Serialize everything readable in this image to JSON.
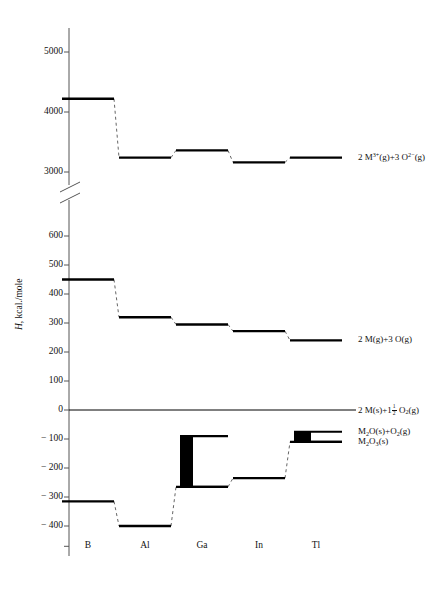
{
  "figure": {
    "y_axis_title": "H, kcal./mole",
    "caption": ""
  },
  "chart_data": {
    "type": "line",
    "title": "",
    "xlabel": "",
    "ylabel": "H, kcal./mole",
    "categories": [
      "B",
      "Al",
      "Ga",
      "In",
      "Tl"
    ],
    "grid": false,
    "legend_position": "right-inline",
    "axis_break": {
      "between": [
        700,
        2900
      ],
      "style": "double-slash"
    },
    "upper_axis": {
      "ticks": [
        3000,
        4000,
        5000
      ],
      "range": [
        2900,
        5400
      ]
    },
    "lower_axis": {
      "ticks": [
        -400,
        -300,
        -200,
        -100,
        0,
        100,
        200,
        300,
        400,
        500,
        600
      ],
      "range": [
        -470,
        700
      ]
    },
    "series": [
      {
        "name": "2 M3+(g)+3 O2-(g)",
        "label_html": "2 M<sup>3+</sup>(g)+3 O<sup>2−</sup>(g)",
        "values": [
          4220,
          3240,
          3360,
          3160,
          3240
        ],
        "style": "dashed-connector-solid-level"
      },
      {
        "name": "2 M(g)+3 O(g)",
        "label_html": "2 M(g)+3 O(g)",
        "values": [
          450,
          320,
          295,
          272,
          240
        ],
        "style": "dashed-connector-solid-level"
      },
      {
        "name": "2 M(s)+1 1/2 O2(g)",
        "label_html": "2 M(s)+1<frac>1/2</frac> O<sub>2</sub>(g)",
        "values": [
          0,
          0,
          0,
          0,
          0
        ],
        "style": "solid-baseline"
      },
      {
        "name": "M2O(s)+O2(g)",
        "label_html": "M<sub>2</sub>O(s)+O<sub>2</sub>(g)",
        "values": [
          null,
          null,
          -90,
          null,
          -75
        ],
        "style": "bar-top"
      },
      {
        "name": "M2O3(s)",
        "label_html": "M<sub>2</sub>O<sub>3</sub>(s)",
        "values": [
          -315,
          -400,
          -265,
          -235,
          -110
        ],
        "style": "dashed-connector-solid-level"
      }
    ],
    "bars": [
      {
        "category": "Ga",
        "top": -90,
        "bottom": -265,
        "fill": "#000000"
      },
      {
        "category": "Tl",
        "top": -75,
        "bottom": -110,
        "fill": "#000000"
      }
    ],
    "annotations": [
      {
        "text": "2 M3+(g)+3 O2-(g)",
        "value": 3240,
        "category": "Tl"
      },
      {
        "text": "2 M(g)+3 O(g)",
        "value": 240,
        "category": "Tl"
      },
      {
        "text": "2 M(s)+1 1/2 O2(g)",
        "value": 0,
        "category": "Tl"
      },
      {
        "text": "M2O(s)+O2(g)",
        "value": -75,
        "category": "Tl"
      },
      {
        "text": "M2O3(s)",
        "value": -110,
        "category": "Tl"
      }
    ]
  },
  "tick_labels": {
    "upper": [
      "5000",
      "4000",
      "3000"
    ],
    "lower": [
      "600",
      "500",
      "400",
      "300",
      "200",
      "100",
      "0",
      "− 100",
      "− 200",
      "− 300",
      "− 400"
    ]
  },
  "element_labels": [
    "B",
    "Al",
    "Ga",
    "In",
    "Tl"
  ],
  "colors": {
    "ink": "#111111",
    "axis": "#555555",
    "level": "#000000",
    "dash": "#666666",
    "bar": "#000000"
  }
}
